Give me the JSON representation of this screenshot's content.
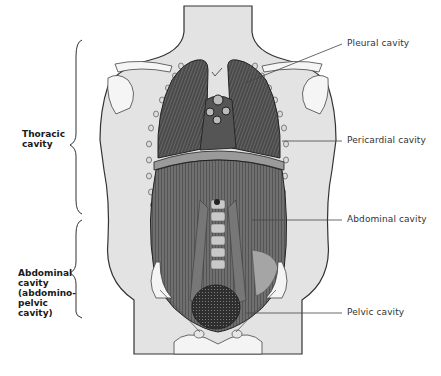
{
  "diagram": {
    "colors": {
      "skin": "#e3e3e3",
      "outline": "#333333",
      "organ_dark": "#3a3a3a",
      "organ_mid": "#6a6a6a",
      "bone": "#f2f2f2",
      "leader": "#444444"
    },
    "left_labels": {
      "thoracic": {
        "lines": [
          "Thoracic",
          "cavity"
        ]
      },
      "abdominal": {
        "lines": [
          "Abdominal",
          "cavity",
          "(abdomino-",
          "pelvic",
          "cavity)"
        ]
      }
    },
    "right_labels": [
      {
        "id": "pleural",
        "text": "Pleural cavity"
      },
      {
        "id": "pericardial",
        "text": "Pericardial cavity"
      },
      {
        "id": "abdominal",
        "text": "Abdominal cavity"
      },
      {
        "id": "pelvic",
        "text": "Pelvic cavity"
      }
    ]
  }
}
